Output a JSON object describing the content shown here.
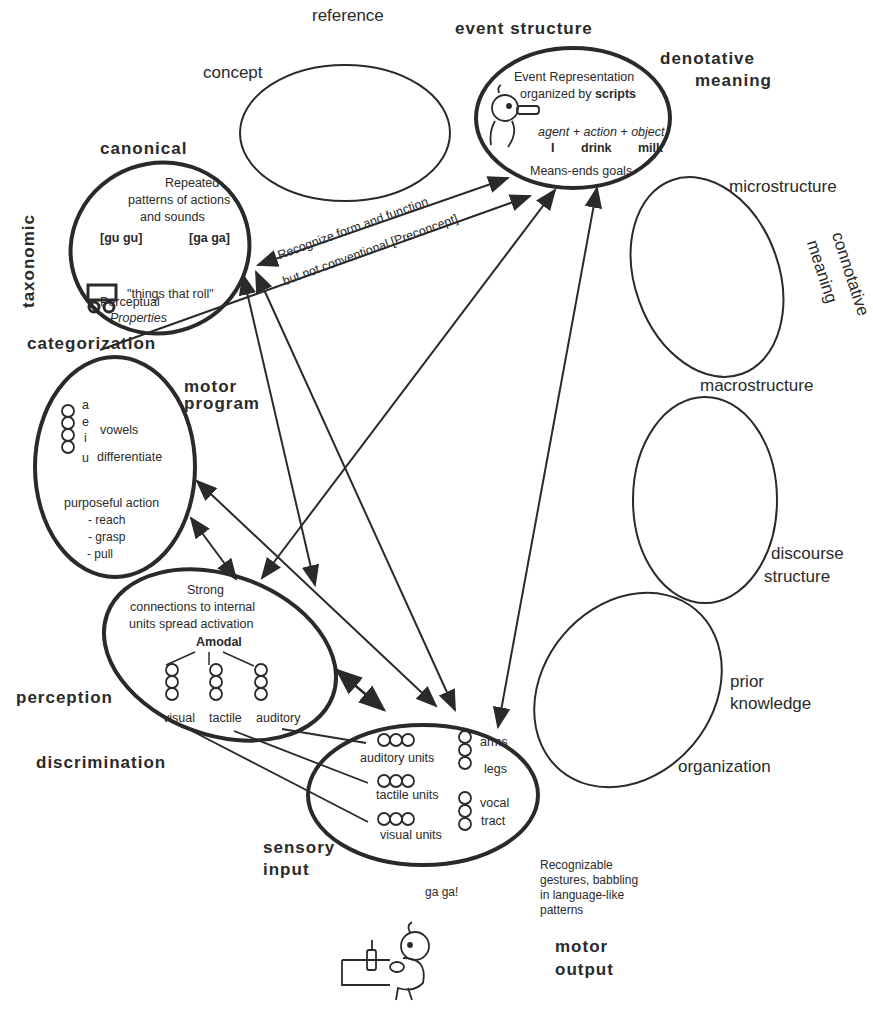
{
  "diagram": {
    "header_labels": {
      "reference": "reference",
      "concept": "concept",
      "event_structure": "event  structure",
      "denotative": "denotative",
      "meaning": "meaning",
      "canonical": "canonical",
      "taxonomic": "taxonomic",
      "microstructure": "microstructure",
      "connotative": "connotative",
      "connotative_meaning": "meaning",
      "categorization": "categorization",
      "motor": "motor",
      "program": "program",
      "macrostructure": "macrostructure",
      "discourse": "discourse",
      "structure": "structure",
      "prior": "prior",
      "knowledge": "knowledge",
      "organization": "organization",
      "perception": "perception",
      "discrimination": "discrimination",
      "sensory": "sensory",
      "input": "input",
      "motor_out": "motor",
      "output": "output"
    },
    "event_node": {
      "line1": "Event Representation",
      "line2a": "organized by ",
      "line2b": "scripts",
      "roles": "agent +  action + object",
      "agent": "I",
      "action": "drink",
      "object": "milk",
      "goals": "Means-ends goals"
    },
    "canonical_node": {
      "line1": "Repeated",
      "line2": "patterns of actions",
      "line3": "and sounds",
      "gugu": "[gu  gu]",
      "gaga": "[ga  ga]",
      "roll": "\"things that roll\"",
      "perceptual": "Perceptual",
      "properties": "Properties"
    },
    "arrow_labels": {
      "line1": "Recognize form and function",
      "line2": "but not conventional  [Preconcept]"
    },
    "motor_program_node": {
      "vowels": [
        "a",
        "e",
        "i",
        "u"
      ],
      "vowels_label": "vowels",
      "differentiate": "differentiate",
      "purposeful": "purposeful action",
      "actions": [
        "- reach",
        "- grasp",
        "- pull"
      ]
    },
    "perception_node": {
      "line1": "Strong",
      "line2": "connections to internal",
      "line3": "units spread activation",
      "amodal": "Amodal",
      "modalities": [
        "visual",
        "tactile",
        "auditory"
      ]
    },
    "sensory_node": {
      "units": [
        "auditory units",
        "tactile units",
        "visual units"
      ],
      "motor_parts": [
        "arms",
        "legs",
        "vocal",
        "tract"
      ]
    },
    "motor_output": {
      "desc": [
        "Recognizable",
        "gestures, babbling",
        "in language-like",
        "patterns"
      ],
      "speech": "ga  ga!"
    },
    "colors": {
      "ink": "#2a2a2a",
      "background": "#ffffff"
    }
  }
}
